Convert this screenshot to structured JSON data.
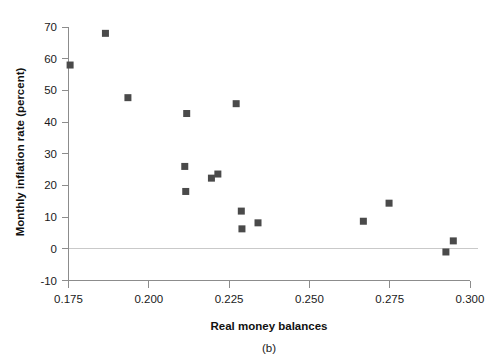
{
  "figure": {
    "caption": "(b)"
  },
  "chart_data": {
    "type": "scatter",
    "title": "",
    "subtitle": "",
    "xlabel": "Real money balances",
    "ylabel": "Monthly inflation rate (percent)",
    "xlim": [
      0.175,
      0.3
    ],
    "ylim": [
      -10,
      70
    ],
    "xticks": [
      0.175,
      0.2,
      0.225,
      0.25,
      0.275,
      0.3
    ],
    "xtick_labels": [
      "0.175",
      "0.200",
      "0.225",
      "0.250",
      "0.275",
      "0.300"
    ],
    "yticks": [
      -10,
      0,
      10,
      20,
      30,
      40,
      50,
      60,
      70
    ],
    "ytick_labels": [
      "-10",
      "0",
      "10",
      "20",
      "30",
      "40",
      "50",
      "60",
      "70"
    ],
    "grid": false,
    "legend": null,
    "marker": "square",
    "marker_color": "#4a4a4a",
    "marker_size": 7,
    "reference_lines": [
      {
        "axis": "y",
        "value": 0,
        "color": "#c9c9c9"
      }
    ],
    "points": [
      {
        "x": 0.1755,
        "y": 58.0
      },
      {
        "x": 0.1865,
        "y": 68.0
      },
      {
        "x": 0.1935,
        "y": 47.7
      },
      {
        "x": 0.2118,
        "y": 42.7
      },
      {
        "x": 0.2112,
        "y": 26.0
      },
      {
        "x": 0.2115,
        "y": 18.1
      },
      {
        "x": 0.2195,
        "y": 22.3
      },
      {
        "x": 0.2215,
        "y": 23.6
      },
      {
        "x": 0.2272,
        "y": 45.8
      },
      {
        "x": 0.2288,
        "y": 11.9
      },
      {
        "x": 0.229,
        "y": 6.3
      },
      {
        "x": 0.234,
        "y": 8.2
      },
      {
        "x": 0.2668,
        "y": 8.7
      },
      {
        "x": 0.2748,
        "y": 14.4
      },
      {
        "x": 0.2925,
        "y": -1.0
      },
      {
        "x": 0.2948,
        "y": 2.5
      }
    ]
  }
}
